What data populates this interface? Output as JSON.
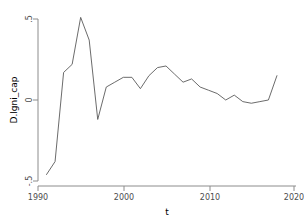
{
  "chart_data": {
    "type": "line",
    "title": "",
    "xlabel": "t",
    "ylabel": "D.lgni_cap",
    "xlim": [
      1990,
      2020
    ],
    "ylim": [
      -0.5,
      0.5
    ],
    "xticks": [
      1990,
      2000,
      2010,
      2020
    ],
    "xtick_labels": [
      "1990",
      "2000",
      "2010",
      "2020"
    ],
    "yticks": [
      -0.5,
      0,
      0.5
    ],
    "ytick_labels": [
      "-.5",
      "0",
      ".5"
    ],
    "grid": false,
    "legend": "none",
    "line_color": "#5a5a5a",
    "axis_color": "#8c8c8c",
    "background_color": "#ffffff",
    "series": [
      {
        "name": "D.lgni_cap",
        "x": [
          1991,
          1992,
          1993,
          1994,
          1995,
          1996,
          1997,
          1998,
          1999,
          2000,
          2001,
          2002,
          2003,
          2004,
          2005,
          2006,
          2007,
          2008,
          2009,
          2010,
          2011,
          2012,
          2013,
          2014,
          2015,
          2016,
          2017,
          2018
        ],
        "values": [
          -0.46,
          -0.38,
          0.17,
          0.22,
          0.51,
          0.37,
          -0.12,
          0.08,
          0.11,
          0.14,
          0.14,
          0.07,
          0.15,
          0.2,
          0.21,
          0.16,
          0.11,
          0.13,
          0.08,
          0.06,
          0.04,
          0.0,
          0.03,
          -0.01,
          -0.02,
          -0.01,
          0.0,
          0.15
        ]
      }
    ]
  },
  "axis": {
    "x_title": "t",
    "y_title": "D.lgni_cap",
    "x_tick_0": "1990",
    "x_tick_1": "2000",
    "x_tick_2": "2010",
    "x_tick_3": "2020",
    "y_tick_top": ".5",
    "y_tick_mid": "0",
    "y_tick_bottom": "-.5"
  }
}
